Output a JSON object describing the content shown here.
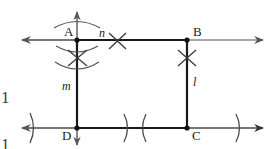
{
  "figure": {
    "background_color": "#ffffff",
    "stroke_color": "#1a1a1a",
    "light_stroke_color": "#6e6e6e",
    "width": 272,
    "height": 149
  },
  "vertices": [
    {
      "id": "A",
      "label": "A",
      "x": 77,
      "y": 40,
      "label_x": 64,
      "label_y": 26
    },
    {
      "id": "B",
      "label": "B",
      "x": 187,
      "y": 40,
      "label_x": 193,
      "label_y": 26
    },
    {
      "id": "C",
      "label": "C",
      "x": 187,
      "y": 128,
      "label_x": 192,
      "label_y": 129
    },
    {
      "id": "D",
      "label": "D",
      "x": 77,
      "y": 128,
      "label_x": 63,
      "label_y": 129
    }
  ],
  "segment_labels": [
    {
      "id": "n",
      "label": "n",
      "x": 99,
      "y": 28,
      "describes": "top-line-label"
    },
    {
      "id": "l",
      "label": "l",
      "x": 193,
      "y": 78,
      "describes": "right-side-label"
    },
    {
      "id": "m",
      "label": "m",
      "x": 64,
      "y": 82,
      "describes": "left-side-label"
    }
  ],
  "edge_fragments": [
    {
      "id": "left-upper-fragment",
      "text": "1",
      "x": 1,
      "y": 91
    },
    {
      "id": "left-lower-fragment",
      "text": "1",
      "x": 1,
      "y": 135
    }
  ],
  "lines": {
    "top_horizontal": {
      "y": 40,
      "x_start": 18,
      "x_end": 266,
      "arrow_left": true,
      "arrow_right": true
    },
    "bottom_horizontal": {
      "y": 128,
      "x_start": 18,
      "x_end": 266,
      "arrow_left": true,
      "arrow_right": true
    },
    "vertical_through_AD": {
      "x": 77,
      "y_start": 8,
      "y_end": 146,
      "arrow_up": true,
      "arrow_down": true
    },
    "vertical_BC": {
      "x": 187,
      "y_start": 40,
      "y_end": 128
    }
  },
  "construction_marks": {
    "cross_marks": [
      {
        "id": "cross-above-A-below",
        "x": 77,
        "y": 58,
        "size": 11
      },
      {
        "id": "cross-on-top-line-right-of-n",
        "x": 117,
        "y": 42,
        "size": 10
      },
      {
        "id": "cross-below-B",
        "x": 187,
        "y": 58,
        "size": 10
      }
    ],
    "compass_arcs": [
      {
        "id": "arc-above-A",
        "cx": 77,
        "cy": 40,
        "r": 28,
        "orientation": "up"
      },
      {
        "id": "arc-below-A-upper",
        "cx": 77,
        "cy": 40,
        "r": 18,
        "orientation": "down"
      },
      {
        "id": "arc-below-A-lower",
        "cx": 77,
        "cy": 40,
        "r": 28,
        "orientation": "down"
      }
    ],
    "tick_arcs_bottom": [
      {
        "id": "tick-arc-left",
        "x": 33,
        "y": 128,
        "facing": "right"
      },
      {
        "id": "tick-arc-mid-left",
        "x": 128,
        "y": 128,
        "facing": "right"
      },
      {
        "id": "tick-arc-mid-right",
        "x": 141,
        "y": 128,
        "facing": "left"
      },
      {
        "id": "tick-arc-right",
        "x": 239,
        "y": 128,
        "facing": "right"
      }
    ]
  }
}
